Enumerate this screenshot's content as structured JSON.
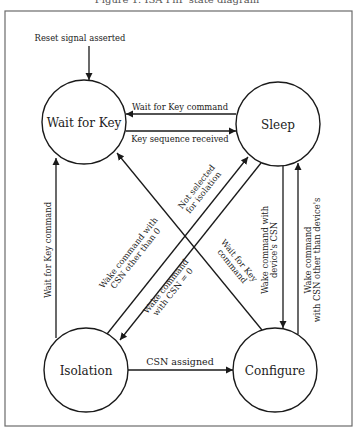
{
  "caption_fragment": "Figure 1. ISA PnP state diagram",
  "nodes": {
    "wait_for_key": "Wait for Key",
    "sleep": "Sleep",
    "isolation": "Isolation",
    "configure": "Configure"
  },
  "edges": {
    "reset": "Reset signal asserted",
    "sleep_to_wfk": "Wait for Key command",
    "wfk_to_sleep": "Key sequence received",
    "iso_to_wfk": "Wait for Key command",
    "cfg_to_wfk_1": "Wait for Key",
    "cfg_to_wfk_2": "command",
    "iso_to_sleep_1": "Not selected",
    "iso_to_sleep_2": "for isolation",
    "sleep_iso_other_1": "Wake command with",
    "sleep_iso_other_2": "CSN other than 0",
    "sleep_iso_zero_1": "Wake command",
    "sleep_iso_zero_2": "with CSN = 0",
    "iso_to_cfg": "CSN assigned",
    "sleep_to_cfg_1": "Wake command with",
    "sleep_to_cfg_2": "device's CSN",
    "cfg_to_sleep_1": "Wake command",
    "cfg_to_sleep_2": "with CSN other than device's"
  },
  "colors": {
    "line": "#1a1a1a",
    "frame": "#6b6b6b",
    "background": "#ffffff"
  }
}
